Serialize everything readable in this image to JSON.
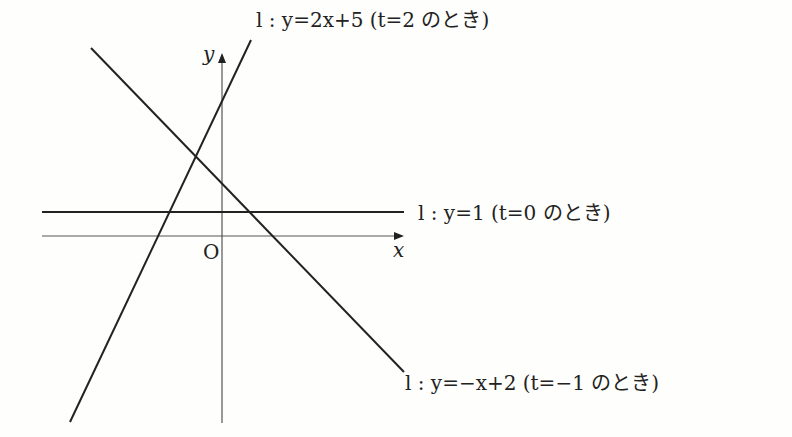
{
  "diagram": {
    "type": "coordinate-plane",
    "axes": {
      "x_label": "x",
      "y_label": "y",
      "origin_label": "O"
    },
    "lines": [
      {
        "id": "line-t2",
        "equation": "y=2x+5",
        "label": "l : y=2x+5 (t=2 のとき)"
      },
      {
        "id": "line-t0",
        "equation": "y=1",
        "label": "l : y=1 (t=0 のとき)"
      },
      {
        "id": "line-tm1",
        "equation": "y=-x+2",
        "label": "l : y=−x+2 (t=−1 のとき)"
      }
    ],
    "colors": {
      "line": "#222222",
      "axis": "#555555",
      "background": "#fefefc"
    }
  }
}
